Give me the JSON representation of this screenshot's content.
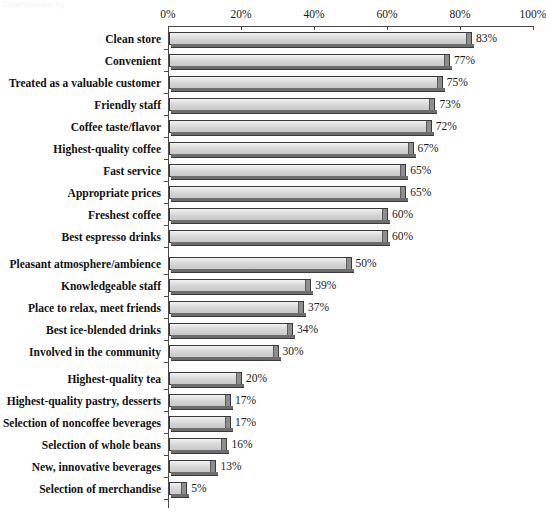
{
  "watermark": "Downloaded by",
  "axis": {
    "ticks": [
      "0%",
      "20%",
      "40%",
      "60%",
      "80%",
      "100%"
    ]
  },
  "chart_data": {
    "type": "bar",
    "orientation": "horizontal",
    "title": "",
    "subtitle": "",
    "xlabel": "",
    "ylabel": "",
    "xlim": [
      0,
      100
    ],
    "xticks": [
      0,
      20,
      40,
      60,
      80,
      100
    ],
    "xtick_labels": [
      "0%",
      "20%",
      "40%",
      "60%",
      "80%",
      "100%"
    ],
    "grid": false,
    "legend": false,
    "value_suffix": "%",
    "categories": [
      "Clean store",
      "Convenient",
      "Treated as a valuable customer",
      "Friendly staff",
      "Coffee taste/flavor",
      "Highest-quality coffee",
      "Fast service",
      "Appropriate prices",
      "Freshest coffee",
      "Best espresso drinks",
      "Pleasant atmosphere/ambience",
      "Knowledgeable staff",
      "Place to relax, meet friends",
      "Best ice-blended drinks",
      "Involved in the community",
      "Highest-quality tea",
      "Highest-quality pastry, desserts",
      "Selection of noncoffee beverages",
      "Selection of whole beans",
      "New, innovative beverages",
      "Selection of merchandise"
    ],
    "values": [
      83,
      77,
      75,
      73,
      72,
      67,
      65,
      65,
      60,
      60,
      50,
      39,
      37,
      34,
      30,
      20,
      17,
      17,
      16,
      13,
      5
    ],
    "value_labels": [
      "83%",
      "77%",
      "75%",
      "73%",
      "72%",
      "67%",
      "65%",
      "65%",
      "60%",
      "60%",
      "50%",
      "39%",
      "37%",
      "34%",
      "30%",
      "20%",
      "17%",
      "17%",
      "16%",
      "13%",
      "5%"
    ],
    "colors": {
      "bar_fill": "#dcdcdc",
      "bar_edge": "#3a3a3a",
      "bar_cap": "#8e8e8e",
      "axis": "#4a4a4a",
      "text": "#121212",
      "background": "#ffffff"
    }
  }
}
